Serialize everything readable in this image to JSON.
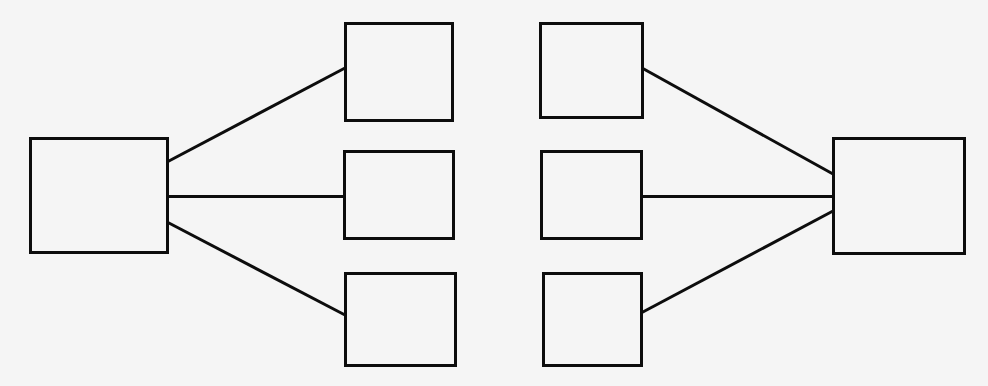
{
  "canvas": {
    "width": 988,
    "height": 386,
    "background_color": "#f5f5f5",
    "stroke_color": "#0d0d0d",
    "stroke_width": 3,
    "node_fill_color": "#f5f5f5",
    "description": "Symmetric fan-out / fan-in block diagram of eight empty rectangles joined by straight line segments. No text labels appear anywhere in the figure."
  },
  "diagram": {
    "type": "node-link-diagram",
    "node_count": 8,
    "edge_count": 6,
    "node_label_text": "",
    "nodes": [
      {
        "id": "left-hub",
        "name": "left-hub-node",
        "column": "left",
        "row": "center",
        "label": "",
        "x": 30,
        "y": 138,
        "width": 137,
        "height": 114
      },
      {
        "id": "mid-left-top",
        "name": "mid-left-top-node",
        "column": "middle-left",
        "row": "top",
        "label": "",
        "x": 345,
        "y": 23,
        "width": 107,
        "height": 97
      },
      {
        "id": "mid-left-center",
        "name": "mid-left-center-node",
        "column": "middle-left",
        "row": "center",
        "label": "",
        "x": 344,
        "y": 151,
        "width": 109,
        "height": 87
      },
      {
        "id": "mid-left-bottom",
        "name": "mid-left-bottom-node",
        "column": "middle-left",
        "row": "bottom",
        "label": "",
        "x": 345,
        "y": 273,
        "width": 110,
        "height": 92
      },
      {
        "id": "mid-right-top",
        "name": "mid-right-top-node",
        "column": "middle-right",
        "row": "top",
        "label": "",
        "x": 540,
        "y": 23,
        "width": 102,
        "height": 94
      },
      {
        "id": "mid-right-center",
        "name": "mid-right-center-node",
        "column": "middle-right",
        "row": "center",
        "label": "",
        "x": 541,
        "y": 151,
        "width": 100,
        "height": 87
      },
      {
        "id": "mid-right-bottom",
        "name": "mid-right-bottom-node",
        "column": "middle-right",
        "row": "bottom",
        "label": "",
        "x": 543,
        "y": 273,
        "width": 98,
        "height": 92
      },
      {
        "id": "right-hub",
        "name": "right-hub-node",
        "column": "right",
        "row": "center",
        "label": "",
        "x": 833,
        "y": 138,
        "width": 131,
        "height": 115
      }
    ],
    "edges": [
      {
        "id": "edge-left-to-top",
        "name": "edge-left-hub-to-mid-left-top",
        "from": "left-hub",
        "to": "mid-left-top",
        "orientation": "diagonal-up",
        "x1": 167,
        "y1": 162,
        "x2": 345,
        "y2": 68
      },
      {
        "id": "edge-left-to-center",
        "name": "edge-left-hub-to-mid-left-center",
        "from": "left-hub",
        "to": "mid-left-center",
        "orientation": "horizontal",
        "x1": 167,
        "y1": 196,
        "x2": 344,
        "y2": 196
      },
      {
        "id": "edge-left-to-bottom",
        "name": "edge-left-hub-to-mid-left-bottom",
        "from": "left-hub",
        "to": "mid-left-bottom",
        "orientation": "diagonal-down",
        "x1": 167,
        "y1": 222,
        "x2": 345,
        "y2": 315
      },
      {
        "id": "edge-top-to-right",
        "name": "edge-mid-right-top-to-right-hub",
        "from": "mid-right-top",
        "to": "right-hub",
        "orientation": "diagonal-down",
        "x1": 642,
        "y1": 68,
        "x2": 833,
        "y2": 174
      },
      {
        "id": "edge-center-to-right",
        "name": "edge-mid-right-center-to-right-hub",
        "from": "mid-right-center",
        "to": "right-hub",
        "orientation": "horizontal",
        "x1": 641,
        "y1": 196,
        "x2": 833,
        "y2": 196
      },
      {
        "id": "edge-bottom-to-right",
        "name": "edge-mid-right-bottom-to-right-hub",
        "from": "mid-right-bottom",
        "to": "right-hub",
        "orientation": "diagonal-up",
        "x1": 641,
        "y1": 313,
        "x2": 833,
        "y2": 211
      }
    ]
  }
}
